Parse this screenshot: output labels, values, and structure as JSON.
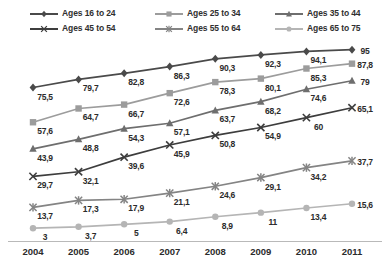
{
  "chart_data": {
    "type": "line",
    "title": "",
    "xlabel": "",
    "ylabel": "",
    "categories": [
      "2004",
      "2005",
      "2006",
      "2007",
      "2008",
      "2009",
      "2010",
      "2011"
    ],
    "x": [
      2004,
      2005,
      2006,
      2007,
      2008,
      2009,
      2010,
      2011
    ],
    "ylim": [
      0,
      100
    ],
    "grid": false,
    "legend_position": "top",
    "legend_columns": 3,
    "legend_rows": 2,
    "data_labels": true,
    "decimal_separator": ",",
    "series": [
      {
        "name": "Ages 16 to 24",
        "color": "#4a4a4a",
        "marker": "diamond",
        "values": [
          75.5,
          79.7,
          82.8,
          86.3,
          90.3,
          92.3,
          94.1,
          95
        ],
        "labels": [
          "75,5",
          "79,7",
          "82,8",
          "86,3",
          "90,3",
          "92,3",
          "94,1",
          "95"
        ]
      },
      {
        "name": "Ages 25 to 34",
        "color": "#9c9c9c",
        "marker": "square",
        "values": [
          57.6,
          64.7,
          66.7,
          72.6,
          78.3,
          80.1,
          85.3,
          87.8
        ],
        "labels": [
          "57,6",
          "64,7",
          "66,7",
          "72,6",
          "78,3",
          "80,1",
          "85,3",
          "87,8"
        ]
      },
      {
        "name": "Ages 35 to 44",
        "color": "#6e6e6e",
        "marker": "triangle",
        "values": [
          43.9,
          48.8,
          54.3,
          57.1,
          63.7,
          68.2,
          74.6,
          79
        ],
        "labels": [
          "43,9",
          "48,8",
          "54,3",
          "57,1",
          "63,7",
          "68,2",
          "74,6",
          "79"
        ]
      },
      {
        "name": "Ages 45 to 54",
        "color": "#3d3d3d",
        "marker": "x",
        "values": [
          29.7,
          32.1,
          39.6,
          45.9,
          50.8,
          54.9,
          60,
          65.1
        ],
        "labels": [
          "29,7",
          "32,1",
          "39,6",
          "45,9",
          "50,8",
          "54,9",
          "60",
          "65,1"
        ]
      },
      {
        "name": "Ages 55 to 64",
        "color": "#848484",
        "marker": "star",
        "values": [
          13.7,
          17.3,
          17.9,
          21.1,
          24.6,
          29.1,
          34.2,
          37.7
        ],
        "labels": [
          "13,7",
          "17,3",
          "17,9",
          "21,1",
          "24,6",
          "29,1",
          "34,2",
          "37,7"
        ]
      },
      {
        "name": "Ages 65 to 75",
        "color": "#b5b5b5",
        "marker": "circle",
        "values": [
          3,
          3.7,
          5,
          6.4,
          8.9,
          11,
          13.4,
          15.6
        ],
        "labels": [
          "3",
          "3,7",
          "5",
          "6,4",
          "8,9",
          "11",
          "13,4",
          "15,6"
        ]
      }
    ]
  }
}
